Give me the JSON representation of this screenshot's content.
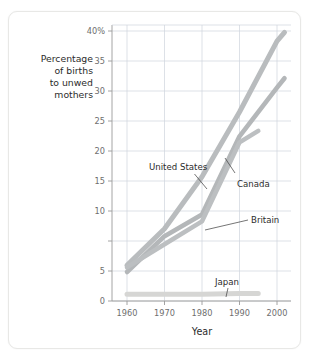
{
  "figure": {
    "frame_color": "#e8e8e6",
    "background": "#ffffff"
  },
  "chart_data": {
    "type": "line",
    "title": "",
    "subtitle": "",
    "xlabel": "Year",
    "ylabel": "Percentage of births to unwed mothers",
    "ylabel_lines": [
      "Percentage",
      "of births",
      "to unwed",
      "mothers"
    ],
    "xlim": [
      1958,
      2004
    ],
    "ylim": [
      0,
      41.5
    ],
    "xticks": [
      1960,
      1970,
      1980,
      1990,
      2000
    ],
    "xticklabels": [
      "1960",
      "1970",
      "1980",
      "1990",
      "2000"
    ],
    "yticks": [
      0,
      5,
      10,
      15,
      20,
      25,
      30,
      35,
      40
    ],
    "yticklabels": [
      "0",
      "5",
      "10",
      "15",
      "20",
      "25",
      "30",
      "35",
      "40%"
    ],
    "grid": true,
    "grid_color": "#cfd4dc",
    "legend": "none",
    "legend_position": "inline-annotations",
    "series": [
      {
        "name": "United States",
        "color": "#b9bcbe",
        "x": [
          1960,
          1970,
          1980,
          1990,
          2000,
          2002
        ],
        "values": [
          5.3,
          10.7,
          18.4,
          28.0,
          38.5,
          39.8
        ]
      },
      {
        "name": "Canada",
        "color": "#b4b7b9",
        "x": [
          1960,
          1970,
          1980,
          1990,
          2000,
          2002
        ],
        "values": [
          4.3,
          9.6,
          12.8,
          24.4,
          31.6,
          33.0
        ]
      },
      {
        "name": "Britain",
        "color": "#bcbfc1",
        "x": [
          1960,
          1970,
          1980,
          1990,
          1995
        ],
        "values": [
          5.0,
          8.4,
          11.8,
          23.5,
          25.2
        ]
      },
      {
        "name": "Japan",
        "color": "#d6d6d4",
        "x": [
          1960,
          1970,
          1980,
          1990,
          1995
        ],
        "values": [
          1.0,
          1.0,
          1.0,
          1.1,
          1.1
        ]
      }
    ],
    "annotations": [
      {
        "label": "United States",
        "anchor_x": 1983,
        "anchor_y": 20.4
      },
      {
        "label": "Canada",
        "anchor_x": 1990,
        "anchor_y": 23.8
      },
      {
        "label": "Britain",
        "anchor_x": 1981,
        "anchor_y": 12.0
      },
      {
        "label": "Japan",
        "anchor_x": 1988,
        "anchor_y": 1.1
      }
    ]
  }
}
